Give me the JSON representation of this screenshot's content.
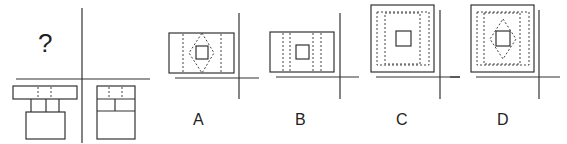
{
  "question": {
    "mark": "?",
    "description": "Three-view drawing puzzle: front view, side view, and top view (unknown) of a 3D object"
  },
  "views": [
    {
      "name": "front-view",
      "position": "bottom-left"
    },
    {
      "name": "side-view",
      "position": "bottom-right"
    },
    {
      "name": "top-view",
      "position": "top-left",
      "value": "?"
    }
  ],
  "options": [
    {
      "label": "A",
      "shape": "rectangle with two vertical dashed lines, dashed diamond, inner solid square"
    },
    {
      "label": "B",
      "shape": "rectangle with four vertical dashed lines, inner solid square"
    },
    {
      "label": "C",
      "shape": "square with inner dashed rectangles, inner solid square"
    },
    {
      "label": "D",
      "shape": "square with inner dashed rectangles, dashed diamond, inner solid square"
    }
  ]
}
